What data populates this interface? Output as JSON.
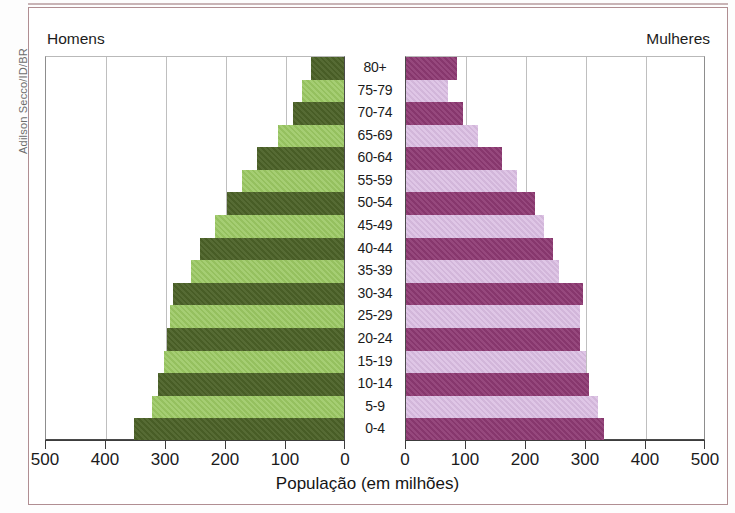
{
  "credit": "Adilson Secco/ID/BR",
  "headers": {
    "left": "Homens",
    "right": "Mulheres"
  },
  "x_title": "População (em milhões)",
  "colors": {
    "men_dark": "#4c6228",
    "men_light": "#9bc863",
    "women_dark": "#8e3a73",
    "women_light": "#dabde2",
    "frame": "#b08e92",
    "gridline": "#bfbfbf",
    "axis": "#3c3c3c"
  },
  "axis_left": {
    "labels": [
      "500",
      "400",
      "300",
      "200",
      "100",
      "0"
    ],
    "values": [
      500,
      400,
      300,
      200,
      100,
      0
    ]
  },
  "axis_right": {
    "labels": [
      "0",
      "100",
      "200",
      "300",
      "400",
      "500"
    ],
    "values": [
      0,
      100,
      200,
      300,
      400,
      500
    ]
  },
  "chart_data": {
    "type": "bar",
    "subtype": "population-pyramid",
    "title": "",
    "xlabel": "População (em milhões)",
    "ylabel": "",
    "xlim": [
      0,
      500
    ],
    "grid": true,
    "legend_position": "top-corners",
    "categories": [
      "80+",
      "75-79",
      "70-74",
      "65-69",
      "60-64",
      "55-59",
      "50-54",
      "45-49",
      "40-44",
      "35-39",
      "30-34",
      "25-29",
      "20-24",
      "15-19",
      "10-14",
      "5-9",
      "0-4"
    ],
    "series": [
      {
        "name": "Homens",
        "side": "left",
        "color": "#4c6228",
        "alt_color": "#9bc863",
        "values": [
          55,
          70,
          85,
          110,
          145,
          170,
          195,
          215,
          240,
          255,
          285,
          290,
          295,
          300,
          310,
          320,
          350
        ]
      },
      {
        "name": "Mulheres",
        "side": "right",
        "color": "#8e3a73",
        "alt_color": "#dabde2",
        "values": [
          85,
          70,
          95,
          120,
          160,
          185,
          215,
          230,
          245,
          255,
          295,
          290,
          290,
          300,
          305,
          320,
          330
        ]
      }
    ]
  }
}
